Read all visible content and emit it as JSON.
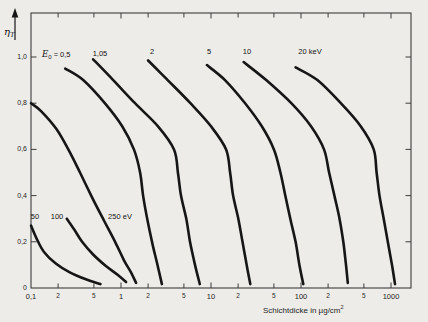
{
  "figure": {
    "background_color": "#edece8",
    "ink_color": "#161616",
    "frame_color": "#3d3d3d",
    "y_axis_symbol": {
      "base": "η",
      "sub": "T"
    },
    "x_axis_title": {
      "text": "Schichtdicke in µg/cm",
      "sup": "2"
    },
    "e0_label": {
      "base": "E",
      "sub": "0",
      "rest": " = 0,5",
      "x": 42,
      "y": 49
    },
    "y_tick_labels": [
      {
        "v": 1.0,
        "t": "1,0"
      },
      {
        "v": 0.8,
        "t": "0,8"
      },
      {
        "v": 0.6,
        "t": "0,6"
      },
      {
        "v": 0.4,
        "t": "0,4"
      },
      {
        "v": 0.2,
        "t": "0,2"
      },
      {
        "v": 0.0,
        "t": "0"
      }
    ],
    "x_major_labels": [
      {
        "v": 0.1,
        "t": "0,1"
      },
      {
        "v": 1,
        "t": "1"
      },
      {
        "v": 10,
        "t": "10"
      },
      {
        "v": 100,
        "t": "100"
      },
      {
        "v": 1000,
        "t": "1000"
      }
    ],
    "x_minor_labels": [
      {
        "v": 0.2,
        "t": "2"
      },
      {
        "v": 0.5,
        "t": "5"
      },
      {
        "v": 2,
        "t": "2"
      },
      {
        "v": 5,
        "t": "5"
      },
      {
        "v": 20,
        "t": "2"
      },
      {
        "v": 50,
        "t": "5"
      },
      {
        "v": 200,
        "t": "2"
      },
      {
        "v": 500,
        "t": "5"
      }
    ],
    "curve_labels": [
      {
        "name": "curve-label-50ev",
        "text": "50",
        "x": 35,
        "y": 216
      },
      {
        "name": "curve-label-100ev",
        "text": "100",
        "x": 57,
        "y": 216
      },
      {
        "name": "curve-label-250ev",
        "text": "250 eV",
        "x": 120,
        "y": 216
      },
      {
        "name": "curve-label-1p05kev",
        "text": "1,05",
        "x": 100,
        "y": 53
      },
      {
        "name": "curve-label-2kev",
        "text": "2",
        "x": 152,
        "y": 51
      },
      {
        "name": "curve-label-5kev",
        "text": "5",
        "x": 209,
        "y": 51
      },
      {
        "name": "curve-label-10kev",
        "text": "10",
        "x": 247,
        "y": 51
      },
      {
        "name": "curve-label-20kev",
        "text": "20 keV",
        "x": 310,
        "y": 51
      }
    ]
  },
  "chart_data": {
    "type": "line",
    "title": "",
    "xlabel": "Schichtdicke in µg/cm²",
    "ylabel": "η_T",
    "x_scale": "log",
    "xlim": [
      0.1,
      1660
    ],
    "ylim": [
      0,
      1.19
    ],
    "grid": false,
    "legend_position": "inline-annotations",
    "x_ticks_major": [
      0.1,
      1,
      10,
      100,
      1000
    ],
    "x_ticks_minor": [
      0.2,
      0.5,
      2,
      5,
      20,
      50,
      200,
      500
    ],
    "y_ticks": [
      0,
      0.2,
      0.4,
      0.6,
      0.8,
      1.0
    ],
    "series": [
      {
        "name": "50 eV",
        "energy_kev": 0.05,
        "points": [
          [
            0.1,
            0.27
          ],
          [
            0.115,
            0.215
          ],
          [
            0.14,
            0.155
          ],
          [
            0.19,
            0.105
          ],
          [
            0.27,
            0.068
          ],
          [
            0.4,
            0.039
          ],
          [
            0.59,
            0.017
          ]
        ]
      },
      {
        "name": "100 eV",
        "energy_kev": 0.1,
        "points": [
          [
            0.25,
            0.3
          ],
          [
            0.3,
            0.255
          ],
          [
            0.37,
            0.2
          ],
          [
            0.49,
            0.145
          ],
          [
            0.68,
            0.095
          ],
          [
            0.93,
            0.055
          ],
          [
            1.14,
            0.026
          ]
        ]
      },
      {
        "name": "250 eV",
        "energy_kev": 0.25,
        "points": [
          [
            0.1,
            0.8
          ],
          [
            0.13,
            0.765
          ],
          [
            0.19,
            0.69
          ],
          [
            0.26,
            0.6
          ],
          [
            0.35,
            0.5
          ],
          [
            0.48,
            0.39
          ],
          [
            0.65,
            0.29
          ],
          [
            0.86,
            0.2
          ],
          [
            1.08,
            0.12
          ],
          [
            1.29,
            0.068
          ],
          [
            1.47,
            0.022
          ]
        ]
      },
      {
        "name": "0,5 keV",
        "energy_kev": 0.5,
        "points": [
          [
            0.24,
            0.95
          ],
          [
            0.38,
            0.9
          ],
          [
            0.66,
            0.8
          ],
          [
            1.03,
            0.7
          ],
          [
            1.39,
            0.6
          ],
          [
            1.63,
            0.5
          ],
          [
            1.76,
            0.4
          ],
          [
            2.0,
            0.28
          ],
          [
            2.27,
            0.18
          ],
          [
            2.58,
            0.09
          ],
          [
            2.85,
            0.017
          ]
        ]
      },
      {
        "name": "1,05 keV",
        "energy_kev": 1.05,
        "points": [
          [
            0.49,
            0.99
          ],
          [
            0.82,
            0.9
          ],
          [
            1.43,
            0.8
          ],
          [
            2.58,
            0.7
          ],
          [
            3.88,
            0.6
          ],
          [
            4.29,
            0.5
          ],
          [
            4.64,
            0.4
          ],
          [
            5.31,
            0.3
          ],
          [
            5.85,
            0.2
          ],
          [
            6.64,
            0.1
          ],
          [
            7.5,
            0.017
          ]
        ]
      },
      {
        "name": "2 keV",
        "energy_kev": 2,
        "points": [
          [
            2.0,
            0.985
          ],
          [
            3.3,
            0.9
          ],
          [
            5.9,
            0.8
          ],
          [
            10.0,
            0.7
          ],
          [
            14.7,
            0.6
          ],
          [
            16.3,
            0.5
          ],
          [
            17.6,
            0.4
          ],
          [
            20.1,
            0.3
          ],
          [
            22.4,
            0.2
          ],
          [
            24.9,
            0.1
          ],
          [
            27.3,
            0.017
          ]
        ]
      },
      {
        "name": "5 keV",
        "energy_kev": 5,
        "points": [
          [
            9.0,
            0.965
          ],
          [
            14.3,
            0.9
          ],
          [
            23.9,
            0.8
          ],
          [
            36.7,
            0.7
          ],
          [
            50,
            0.6
          ],
          [
            59,
            0.5
          ],
          [
            67,
            0.4
          ],
          [
            76,
            0.3
          ],
          [
            87,
            0.2
          ],
          [
            96,
            0.1
          ],
          [
            106,
            0.017
          ]
        ]
      },
      {
        "name": "10 keV",
        "energy_kev": 10,
        "points": [
          [
            23,
            0.978
          ],
          [
            41,
            0.9
          ],
          [
            78,
            0.8
          ],
          [
            129,
            0.7
          ],
          [
            180,
            0.6
          ],
          [
            205,
            0.5
          ],
          [
            235,
            0.4
          ],
          [
            268,
            0.3
          ],
          [
            295,
            0.2
          ],
          [
            316,
            0.1
          ],
          [
            331,
            0.022
          ]
        ]
      },
      {
        "name": "20 keV",
        "energy_kev": 20,
        "points": [
          [
            87,
            0.955
          ],
          [
            152,
            0.9
          ],
          [
            277,
            0.8
          ],
          [
            461,
            0.7
          ],
          [
            642,
            0.6
          ],
          [
            692,
            0.5
          ],
          [
            745,
            0.4
          ],
          [
            829,
            0.3
          ],
          [
            922,
            0.2
          ],
          [
            1026,
            0.1
          ],
          [
            1107,
            0.017
          ]
        ]
      }
    ]
  }
}
